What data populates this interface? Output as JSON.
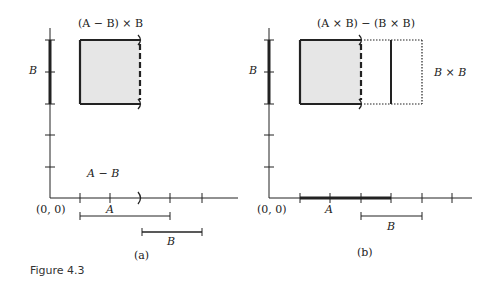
{
  "figure": {
    "caption": "Figure 4.3",
    "panels": [
      {
        "id": "a",
        "label": "(a)",
        "title": "(A − B) × B",
        "y_axis_label": "B",
        "origin_label": "(0, 0)",
        "region_label": "A − B",
        "a_bar_label": "A",
        "b_bar_label": "B"
      },
      {
        "id": "b",
        "label": "(b)",
        "title": "(A × B) − (B × B)",
        "y_axis_label": "B",
        "origin_label": "(0, 0)",
        "side_label": "B × B",
        "a_bar_label": "A",
        "b_bar_label": "B"
      }
    ],
    "colors": {
      "ink": "#222222",
      "fill": "#e6e6e6"
    }
  }
}
